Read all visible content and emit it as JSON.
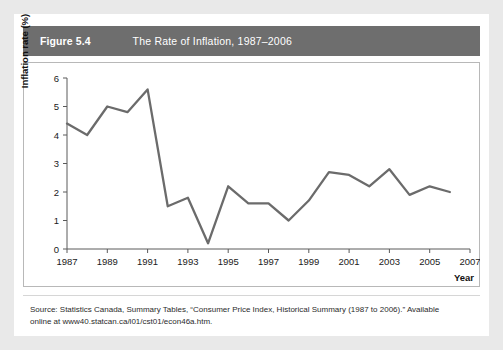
{
  "figure": {
    "number": "Figure 5.4",
    "title": "The Rate of Inflation, 1987–2006"
  },
  "source": {
    "line1": "Source: Statistics Canada, Summary Tables, “Consumer Price Index, Historical Summary (1987 to 2006).” Available",
    "line2": "online at www40.statcan.ca/l01/cst01/econ46a.htm."
  },
  "colors": {
    "header_bar": "#6e6e6e",
    "line": "#6b6b6b",
    "axis": "#5a5a5a",
    "plot_border": "#b8b8b8",
    "page_background": "#e9e9e9",
    "card_background": "#ffffff"
  },
  "chart_data": {
    "type": "line",
    "title": "The Rate of Inflation, 1987–2006",
    "xlabel": "Year",
    "ylabel": "Inflation rate (%)",
    "xlim": [
      1987,
      2007
    ],
    "ylim": [
      0,
      6
    ],
    "grid": false,
    "legend": "none",
    "x_tick_labels": [
      "1987",
      "1989",
      "1991",
      "1993",
      "1995",
      "1997",
      "1999",
      "2001",
      "2003",
      "2005",
      "2007"
    ],
    "x_tick_values": [
      1987,
      1989,
      1991,
      1993,
      1995,
      1997,
      1999,
      2001,
      2003,
      2005,
      2007
    ],
    "y_tick_labels": [
      "0",
      "1",
      "2",
      "3",
      "4",
      "5",
      "6"
    ],
    "y_tick_values": [
      0,
      1,
      2,
      3,
      4,
      5,
      6
    ],
    "x": [
      1987,
      1988,
      1989,
      1990,
      1991,
      1992,
      1993,
      1994,
      1995,
      1996,
      1997,
      1998,
      1999,
      2000,
      2001,
      2002,
      2003,
      2004,
      2005,
      2006
    ],
    "values": [
      4.4,
      4.0,
      5.0,
      4.8,
      5.6,
      1.5,
      1.8,
      0.2,
      2.2,
      1.6,
      1.6,
      1.0,
      1.7,
      2.7,
      2.6,
      2.2,
      2.8,
      1.9,
      2.2,
      2.0
    ],
    "series": [
      {
        "name": "Inflation rate (%)",
        "values": [
          4.4,
          4.0,
          5.0,
          4.8,
          5.6,
          1.5,
          1.8,
          0.2,
          2.2,
          1.6,
          1.6,
          1.0,
          1.7,
          2.7,
          2.6,
          2.2,
          2.8,
          1.9,
          2.2,
          2.0
        ]
      }
    ]
  }
}
